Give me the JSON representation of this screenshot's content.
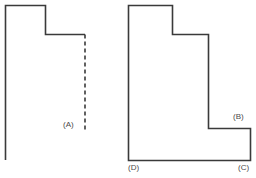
{
  "figure": {
    "background_color": "#ffffff",
    "stroke_color": "#3a3a3a",
    "stroke_width": 1.6,
    "label_color": "#4a4a4a",
    "left_figure": {
      "name": "open-stepped-outline",
      "solid_path": "M 5.5,160 L 5.5,5.5 L 45.5,5.5 L 45.5,34.5 L 85,34.5",
      "dashed_path": "M 85,34.5 L 85,132",
      "dash_pattern": "4 3",
      "labels": [
        {
          "id": "A",
          "text": "(A)",
          "x": 63,
          "y": 120
        }
      ]
    },
    "right_figure": {
      "name": "closed-stepped-polygon",
      "solid_path": "M 128.5,160.5 L 128.5,5.5 L 172.5,5.5 L 172.5,34.5 L 208.5,34.5 L 208.5,128.5 L 250.5,128.5 L 250.5,160.5 Z",
      "labels": [
        {
          "id": "B",
          "text": "(B)",
          "x": 233,
          "y": 112
        },
        {
          "id": "C",
          "text": "(C)",
          "x": 238,
          "y": 163
        },
        {
          "id": "D",
          "text": "(D)",
          "x": 128,
          "y": 163
        }
      ]
    }
  }
}
